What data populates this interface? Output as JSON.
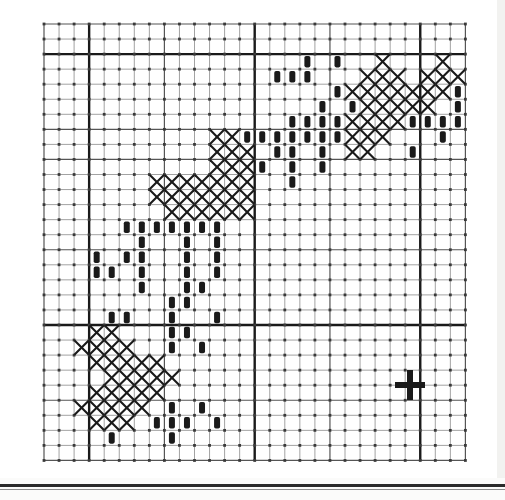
{
  "page": {
    "kind": "cross-stitch-pattern-chart",
    "background_color": "#ffffff",
    "ink_color": "#1a1a1a",
    "grid_line_color": "#555555",
    "grid_minor_color": "#8a8a8a",
    "footer_rule_color": "#2b2b2b"
  },
  "chart_data": {
    "type": "heatmap",
    "title": "",
    "subtitle": "",
    "xlabel": "",
    "ylabel": "",
    "grid": true,
    "legend_position": "none",
    "geometry": {
      "origin_x": 44,
      "origin_y": 24,
      "cell": 15.05,
      "cols": 28,
      "rows": 29,
      "major_cols": [
        3,
        14,
        25
      ],
      "major_rows": [
        2,
        20
      ],
      "medium_cols": [
        8,
        19
      ],
      "medium_rows": [
        7,
        9,
        15,
        25
      ],
      "line_widths": {
        "minor": 0.8,
        "medium": 1.2,
        "major": 2.4
      }
    },
    "symbols": [
      {
        "key": "x",
        "label": "X",
        "description": "cross stitch"
      },
      {
        "key": "b",
        "label": "bar",
        "description": "filled vertical bar / backstitch bead"
      }
    ],
    "legend": [],
    "cells": [
      {
        "s": "b",
        "c": 17,
        "r": 2
      },
      {
        "s": "b",
        "c": 19,
        "r": 2
      },
      {
        "s": "x",
        "c": 22,
        "r": 2
      },
      {
        "s": "x",
        "c": 26,
        "r": 2
      },
      {
        "s": "b",
        "c": 15,
        "r": 3
      },
      {
        "s": "b",
        "c": 16,
        "r": 3
      },
      {
        "s": "b",
        "c": 17,
        "r": 3
      },
      {
        "s": "x",
        "c": 21,
        "r": 3
      },
      {
        "s": "x",
        "c": 22,
        "r": 3
      },
      {
        "s": "x",
        "c": 23,
        "r": 3
      },
      {
        "s": "x",
        "c": 25,
        "r": 3
      },
      {
        "s": "x",
        "c": 26,
        "r": 3
      },
      {
        "s": "x",
        "c": 27,
        "r": 3
      },
      {
        "s": "b",
        "c": 19,
        "r": 4
      },
      {
        "s": "x",
        "c": 20,
        "r": 4
      },
      {
        "s": "x",
        "c": 21,
        "r": 4
      },
      {
        "s": "x",
        "c": 22,
        "r": 4
      },
      {
        "s": "x",
        "c": 23,
        "r": 4
      },
      {
        "s": "x",
        "c": 24,
        "r": 4
      },
      {
        "s": "x",
        "c": 25,
        "r": 4
      },
      {
        "s": "x",
        "c": 26,
        "r": 4
      },
      {
        "s": "b",
        "c": 27,
        "r": 4
      },
      {
        "s": "b",
        "c": 18,
        "r": 5
      },
      {
        "s": "b",
        "c": 20,
        "r": 5
      },
      {
        "s": "x",
        "c": 21,
        "r": 5
      },
      {
        "s": "x",
        "c": 22,
        "r": 5
      },
      {
        "s": "x",
        "c": 23,
        "r": 5
      },
      {
        "s": "x",
        "c": 24,
        "r": 5
      },
      {
        "s": "x",
        "c": 25,
        "r": 5
      },
      {
        "s": "b",
        "c": 27,
        "r": 5
      },
      {
        "s": "b",
        "c": 16,
        "r": 6
      },
      {
        "s": "b",
        "c": 17,
        "r": 6
      },
      {
        "s": "b",
        "c": 18,
        "r": 6
      },
      {
        "s": "b",
        "c": 19,
        "r": 6
      },
      {
        "s": "x",
        "c": 20,
        "r": 6
      },
      {
        "s": "x",
        "c": 21,
        "r": 6
      },
      {
        "s": "x",
        "c": 22,
        "r": 6
      },
      {
        "s": "x",
        "c": 23,
        "r": 6
      },
      {
        "s": "b",
        "c": 24,
        "r": 6
      },
      {
        "s": "b",
        "c": 25,
        "r": 6
      },
      {
        "s": "b",
        "c": 26,
        "r": 6
      },
      {
        "s": "b",
        "c": 27,
        "r": 6
      },
      {
        "s": "x",
        "c": 11,
        "r": 7
      },
      {
        "s": "x",
        "c": 12,
        "r": 7
      },
      {
        "s": "b",
        "c": 13,
        "r": 7
      },
      {
        "s": "b",
        "c": 14,
        "r": 7
      },
      {
        "s": "b",
        "c": 15,
        "r": 7
      },
      {
        "s": "b",
        "c": 16,
        "r": 7
      },
      {
        "s": "b",
        "c": 17,
        "r": 7
      },
      {
        "s": "b",
        "c": 18,
        "r": 7
      },
      {
        "s": "b",
        "c": 19,
        "r": 7
      },
      {
        "s": "x",
        "c": 20,
        "r": 7
      },
      {
        "s": "x",
        "c": 21,
        "r": 7
      },
      {
        "s": "x",
        "c": 22,
        "r": 7
      },
      {
        "s": "b",
        "c": 26,
        "r": 7
      },
      {
        "s": "x",
        "c": 11,
        "r": 8
      },
      {
        "s": "x",
        "c": 12,
        "r": 8
      },
      {
        "s": "x",
        "c": 13,
        "r": 8
      },
      {
        "s": "b",
        "c": 15,
        "r": 8
      },
      {
        "s": "b",
        "c": 16,
        "r": 8
      },
      {
        "s": "b",
        "c": 18,
        "r": 8
      },
      {
        "s": "x",
        "c": 20,
        "r": 8
      },
      {
        "s": "x",
        "c": 21,
        "r": 8
      },
      {
        "s": "b",
        "c": 24,
        "r": 8
      },
      {
        "s": "x",
        "c": 11,
        "r": 9
      },
      {
        "s": "x",
        "c": 12,
        "r": 9
      },
      {
        "s": "x",
        "c": 13,
        "r": 9
      },
      {
        "s": "b",
        "c": 14,
        "r": 9
      },
      {
        "s": "b",
        "c": 16,
        "r": 9
      },
      {
        "s": "b",
        "c": 18,
        "r": 9
      },
      {
        "s": "x",
        "c": 7,
        "r": 10
      },
      {
        "s": "x",
        "c": 8,
        "r": 10
      },
      {
        "s": "x",
        "c": 9,
        "r": 10
      },
      {
        "s": "x",
        "c": 10,
        "r": 10
      },
      {
        "s": "x",
        "c": 11,
        "r": 10
      },
      {
        "s": "x",
        "c": 12,
        "r": 10
      },
      {
        "s": "x",
        "c": 13,
        "r": 10
      },
      {
        "s": "b",
        "c": 16,
        "r": 10
      },
      {
        "s": "x",
        "c": 7,
        "r": 11
      },
      {
        "s": "x",
        "c": 8,
        "r": 11
      },
      {
        "s": "x",
        "c": 9,
        "r": 11
      },
      {
        "s": "x",
        "c": 10,
        "r": 11
      },
      {
        "s": "x",
        "c": 11,
        "r": 11
      },
      {
        "s": "x",
        "c": 12,
        "r": 11
      },
      {
        "s": "x",
        "c": 13,
        "r": 11
      },
      {
        "s": "x",
        "c": 8,
        "r": 12
      },
      {
        "s": "x",
        "c": 9,
        "r": 12
      },
      {
        "s": "x",
        "c": 10,
        "r": 12
      },
      {
        "s": "x",
        "c": 11,
        "r": 12
      },
      {
        "s": "x",
        "c": 12,
        "r": 12
      },
      {
        "s": "x",
        "c": 13,
        "r": 12
      },
      {
        "s": "b",
        "c": 5,
        "r": 13
      },
      {
        "s": "b",
        "c": 6,
        "r": 13
      },
      {
        "s": "b",
        "c": 7,
        "r": 13
      },
      {
        "s": "b",
        "c": 8,
        "r": 13
      },
      {
        "s": "b",
        "c": 9,
        "r": 13
      },
      {
        "s": "b",
        "c": 10,
        "r": 13
      },
      {
        "s": "b",
        "c": 11,
        "r": 13
      },
      {
        "s": "b",
        "c": 6,
        "r": 14
      },
      {
        "s": "b",
        "c": 9,
        "r": 14
      },
      {
        "s": "b",
        "c": 11,
        "r": 14
      },
      {
        "s": "b",
        "c": 3,
        "r": 15
      },
      {
        "s": "b",
        "c": 5,
        "r": 15
      },
      {
        "s": "b",
        "c": 6,
        "r": 15
      },
      {
        "s": "b",
        "c": 9,
        "r": 15
      },
      {
        "s": "b",
        "c": 11,
        "r": 15
      },
      {
        "s": "b",
        "c": 3,
        "r": 16
      },
      {
        "s": "b",
        "c": 4,
        "r": 16
      },
      {
        "s": "b",
        "c": 6,
        "r": 16
      },
      {
        "s": "b",
        "c": 9,
        "r": 16
      },
      {
        "s": "b",
        "c": 11,
        "r": 16
      },
      {
        "s": "b",
        "c": 6,
        "r": 17
      },
      {
        "s": "b",
        "c": 9,
        "r": 17
      },
      {
        "s": "b",
        "c": 10,
        "r": 17
      },
      {
        "s": "b",
        "c": 8,
        "r": 18
      },
      {
        "s": "b",
        "c": 9,
        "r": 18
      },
      {
        "s": "b",
        "c": 4,
        "r": 19
      },
      {
        "s": "b",
        "c": 5,
        "r": 19
      },
      {
        "s": "b",
        "c": 8,
        "r": 19
      },
      {
        "s": "b",
        "c": 11,
        "r": 19
      },
      {
        "s": "x",
        "c": 3,
        "r": 20
      },
      {
        "s": "x",
        "c": 4,
        "r": 20
      },
      {
        "s": "b",
        "c": 8,
        "r": 20
      },
      {
        "s": "b",
        "c": 9,
        "r": 20
      },
      {
        "s": "x",
        "c": 2,
        "r": 21
      },
      {
        "s": "x",
        "c": 3,
        "r": 21
      },
      {
        "s": "x",
        "c": 4,
        "r": 21
      },
      {
        "s": "x",
        "c": 5,
        "r": 21
      },
      {
        "s": "b",
        "c": 8,
        "r": 21
      },
      {
        "s": "b",
        "c": 10,
        "r": 21
      },
      {
        "s": "x",
        "c": 3,
        "r": 22
      },
      {
        "s": "x",
        "c": 4,
        "r": 22
      },
      {
        "s": "x",
        "c": 5,
        "r": 22
      },
      {
        "s": "x",
        "c": 6,
        "r": 22
      },
      {
        "s": "x",
        "c": 7,
        "r": 22
      },
      {
        "s": "x",
        "c": 4,
        "r": 23
      },
      {
        "s": "x",
        "c": 5,
        "r": 23
      },
      {
        "s": "x",
        "c": 6,
        "r": 23
      },
      {
        "s": "x",
        "c": 7,
        "r": 23
      },
      {
        "s": "x",
        "c": 8,
        "r": 23
      },
      {
        "s": "x",
        "c": 3,
        "r": 24
      },
      {
        "s": "x",
        "c": 4,
        "r": 24
      },
      {
        "s": "x",
        "c": 5,
        "r": 24
      },
      {
        "s": "x",
        "c": 6,
        "r": 24
      },
      {
        "s": "x",
        "c": 7,
        "r": 24
      },
      {
        "s": "x",
        "c": 2,
        "r": 25
      },
      {
        "s": "x",
        "c": 3,
        "r": 25
      },
      {
        "s": "x",
        "c": 4,
        "r": 25
      },
      {
        "s": "x",
        "c": 5,
        "r": 25
      },
      {
        "s": "x",
        "c": 6,
        "r": 25
      },
      {
        "s": "b",
        "c": 8,
        "r": 25
      },
      {
        "s": "b",
        "c": 10,
        "r": 25
      },
      {
        "s": "x",
        "c": 3,
        "r": 26
      },
      {
        "s": "x",
        "c": 4,
        "r": 26
      },
      {
        "s": "x",
        "c": 5,
        "r": 26
      },
      {
        "s": "b",
        "c": 7,
        "r": 26
      },
      {
        "s": "b",
        "c": 8,
        "r": 26
      },
      {
        "s": "b",
        "c": 9,
        "r": 26
      },
      {
        "s": "b",
        "c": 11,
        "r": 26
      },
      {
        "s": "b",
        "c": 4,
        "r": 27
      },
      {
        "s": "b",
        "c": 8,
        "r": 27
      }
    ],
    "markers": [
      {
        "name": "registration-cross",
        "label": "+",
        "x": 410,
        "y": 385,
        "size": 30,
        "stroke": 6
      }
    ]
  }
}
